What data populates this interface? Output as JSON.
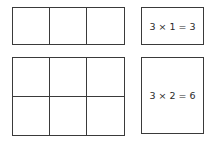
{
  "diagram": {
    "rows": [
      {
        "grid": {
          "columns": 3,
          "rows": 1
        },
        "equation": "3 × 1 = 3"
      },
      {
        "grid": {
          "columns": 3,
          "rows": 2
        },
        "equation": "3 × 2 = 6"
      }
    ]
  }
}
